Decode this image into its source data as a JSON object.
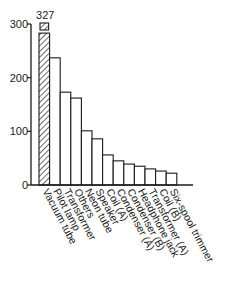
{
  "chart_data": {
    "type": "bar",
    "title": "",
    "xlabel": "",
    "ylabel": "",
    "ylim": [
      0,
      300
    ],
    "yticks": [
      0,
      100,
      200,
      300
    ],
    "grid": false,
    "legend": null,
    "categories": [
      "Vacuum tube",
      "Pilot lamp",
      "Transformer",
      "Others",
      "Neon tube",
      "Speaker",
      "Coil (A)",
      "Condenser (A)",
      "Condenser (B)",
      "Headphone jack",
      "Transformer (A)",
      "Coil (B)",
      "Six-spool trimmer"
    ],
    "values": [
      327,
      237,
      173,
      162,
      101,
      86,
      56,
      45,
      39,
      35,
      30,
      26,
      22
    ],
    "annotations": [
      {
        "category": "Vacuum tube",
        "text": "327",
        "note": "bar broken above axis max; hatched"
      }
    ],
    "highlighted": {
      "category": "Vacuum tube",
      "style": "hatched"
    }
  },
  "labels": {
    "overflow_value": "327"
  }
}
